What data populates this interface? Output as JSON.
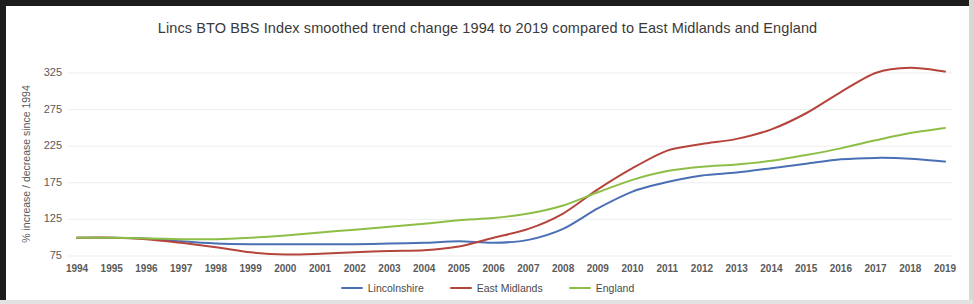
{
  "chart_data": {
    "type": "line",
    "title": "Lincs BTO BBS Index smoothed trend change 1994 to 2019 compared to East Midlands and England",
    "xlabel": "",
    "ylabel": "% increase / decrease since 1994",
    "x": [
      1994,
      1995,
      1996,
      1997,
      1998,
      1999,
      2000,
      2001,
      2002,
      2003,
      2004,
      2005,
      2006,
      2007,
      2008,
      2009,
      2010,
      2011,
      2012,
      2013,
      2014,
      2015,
      2016,
      2017,
      2018,
      2019
    ],
    "categories": [
      "1994",
      "1995",
      "1996",
      "1997",
      "1998",
      "1999",
      "2000",
      "2001",
      "2002",
      "2003",
      "2004",
      "2005",
      "2006",
      "2007",
      "2008",
      "2009",
      "2010",
      "2011",
      "2012",
      "2013",
      "2014",
      "2015",
      "2016",
      "2017",
      "2018",
      "2019"
    ],
    "series": [
      {
        "name": "Lincolnshire",
        "color": "#4a6fb5",
        "values": [
          100,
          100,
          99,
          95,
          92,
          91,
          91,
          91,
          91,
          92,
          93,
          95,
          93,
          97,
          112,
          140,
          163,
          176,
          185,
          189,
          195,
          201,
          207,
          209,
          208,
          204
        ]
      },
      {
        "name": "East Midlands",
        "color": "#b5453c",
        "values": [
          100,
          100,
          98,
          93,
          87,
          80,
          77,
          78,
          80,
          82,
          83,
          88,
          100,
          112,
          133,
          166,
          195,
          219,
          228,
          235,
          248,
          270,
          299,
          325,
          332,
          327
        ]
      },
      {
        "name": "England",
        "color": "#8dbe46",
        "values": [
          100,
          100,
          99,
          98,
          98,
          100,
          103,
          107,
          111,
          115,
          119,
          124,
          127,
          133,
          144,
          162,
          179,
          191,
          197,
          200,
          205,
          213,
          222,
          233,
          243,
          250
        ]
      }
    ],
    "ylim": [
      75,
      340
    ],
    "yticks": [
      75,
      125,
      175,
      225,
      275,
      325
    ],
    "grid": "horizontal",
    "legend_position": "bottom"
  },
  "legend": {
    "items": [
      {
        "label": "Lincolnshire",
        "color": "#4a6fb5"
      },
      {
        "label": "East Midlands",
        "color": "#b5453c"
      },
      {
        "label": "England",
        "color": "#8dbe46"
      }
    ]
  }
}
